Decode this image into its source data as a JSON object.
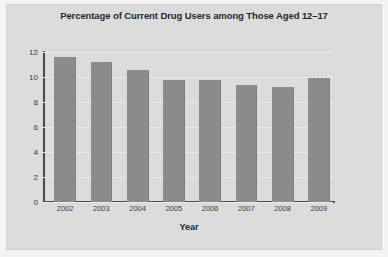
{
  "figure": {
    "panel_color": "#dcdcdc",
    "bar_color": "#8b8b8b",
    "axis_color": "#4b4b4b",
    "grid_color": "#ececec"
  },
  "chart_data": {
    "type": "bar",
    "title": "Percentage of Current Drug Users among Those Aged 12–17",
    "xlabel": "Year",
    "ylabel": "",
    "categories": [
      "2002",
      "2003",
      "2004",
      "2005",
      "2006",
      "2007",
      "2008",
      "2009"
    ],
    "values": [
      11.6,
      11.2,
      10.6,
      9.8,
      9.8,
      9.4,
      9.2,
      9.9
    ],
    "ylim": [
      0,
      12
    ],
    "yticks": [
      "0",
      "2",
      "4",
      "6",
      "8",
      "10",
      "12"
    ],
    "ytick_values": [
      0,
      2,
      4,
      6,
      8,
      10,
      12
    ],
    "grid": true,
    "legend": false
  }
}
